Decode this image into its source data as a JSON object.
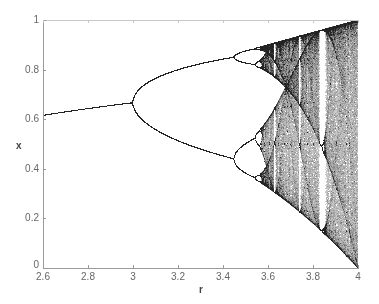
{
  "chart_data": {
    "type": "scatter",
    "title": "",
    "subtitle": "",
    "xlabel": "r",
    "ylabel": "x",
    "xlim": [
      2.6,
      4
    ],
    "ylim": [
      0,
      1
    ],
    "grid": false,
    "legend": null,
    "x_ticks": [
      2.6,
      2.8,
      3,
      3.2,
      3.4,
      3.6,
      3.8,
      4
    ],
    "x_tick_labels": [
      "2.6",
      "2.8",
      "3",
      "3.2",
      "3.4",
      "3.6",
      "3.8",
      "4"
    ],
    "y_ticks": [
      0,
      0.2,
      0.4,
      0.6,
      0.8,
      1
    ],
    "y_tick_labels": [
      "0",
      "0.2",
      "0.4",
      "0.6",
      "0.8",
      "1"
    ],
    "series": [
      {
        "name": "logistic map attractor",
        "equation": "x_{n+1} = r * x_n * (1 - x_n)",
        "r_range": [
          2.6,
          4
        ],
        "key_points": [
          {
            "r": 2.6,
            "x": [
              0.615
            ]
          },
          {
            "r": 2.8,
            "x": [
              0.643
            ]
          },
          {
            "r": 3.0,
            "x": [
              0.667
            ]
          },
          {
            "r": 3.2,
            "x": [
              0.513,
              0.799
            ]
          },
          {
            "r": 3.4,
            "x": [
              0.452,
              0.842
            ]
          },
          {
            "r": 3.5,
            "x": [
              0.383,
              0.501,
              0.827,
              0.875
            ]
          },
          {
            "r": 3.57,
            "onset_of_chaos": true
          },
          {
            "r": 3.83,
            "period_3_window": true
          },
          {
            "r": 4.0,
            "x_range": [
              0,
              1
            ]
          }
        ]
      }
    ],
    "point_color": "#222222"
  },
  "axes": {
    "x_label": "r",
    "y_label": "x"
  }
}
